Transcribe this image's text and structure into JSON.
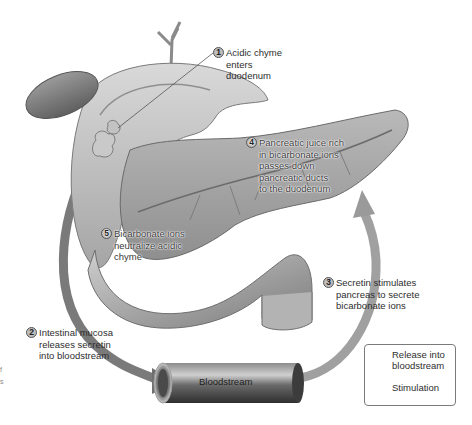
{
  "figure": {
    "colors": {
      "background": "#ffffff",
      "organ_light": "#d6d6d6",
      "organ_mid": "#a9a9a9",
      "organ_dark": "#6e6e6e",
      "release_arrow": "#6f6f6f",
      "stimulation_arrow": "#9a9a9a",
      "tube": "#4a4a4a"
    }
  },
  "steps": [
    {
      "number": "1",
      "lines": [
        "Acidic chyme",
        "enters",
        "duodenum"
      ]
    },
    {
      "number": "2",
      "lines": [
        "Intestinal mucosa",
        "releases secretin",
        "into bloodstream"
      ]
    },
    {
      "number": "3",
      "lines": [
        "Secretin stimulates",
        "pancreas to secrete",
        "bicarbonate ions"
      ]
    },
    {
      "number": "4",
      "lines": [
        "Pancreatic juice rich",
        "in bicarbonate ions",
        "passes down",
        "pancreatic ducts",
        "to the duodenum"
      ]
    },
    {
      "number": "5",
      "lines": [
        "Bicarbonate ions",
        "neutralize acidic",
        "chyme"
      ]
    }
  ],
  "bloodstream": {
    "label": "Bloodstream"
  },
  "legend": {
    "items": [
      {
        "icon": "release-arrow-icon",
        "label_lines": [
          "Release into",
          "bloodstream"
        ]
      },
      {
        "icon": "stimulation-arrow-icon",
        "label_lines": [
          "Stimulation"
        ]
      }
    ]
  },
  "edge_fragments": [
    "f",
    "s"
  ]
}
